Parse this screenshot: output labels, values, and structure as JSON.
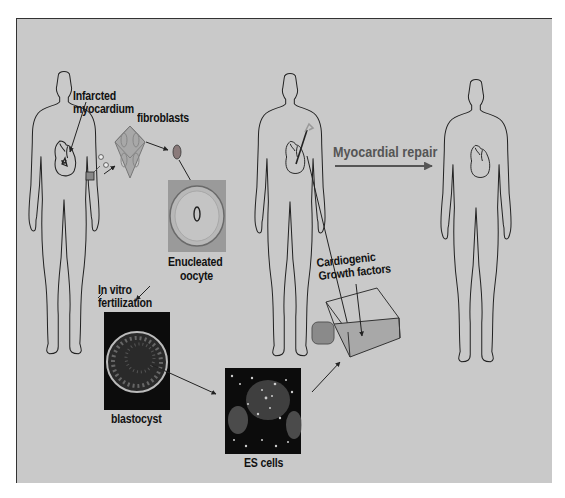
{
  "figure": {
    "background": "#c9c9c9",
    "labels": {
      "infarcted": "Infarcted",
      "myocardium": "myocardium",
      "fibroblasts": "fibroblasts",
      "enucleated": "Enucleated",
      "oocyte": "oocyte",
      "in_vitro": "In vitro",
      "fertilization": "fertilization",
      "blastocyst": "blastocyst",
      "es_cells": "ES cells",
      "cardiogenic": "Cardiogenic",
      "growth_factors": "Growth factors",
      "myocardial_repair": "Myocardial repair"
    },
    "stages": [
      "Infarcted myocardium",
      "fibroblasts",
      "Enucleated oocyte",
      "In vitro fertilization",
      "blastocyst",
      "ES cells",
      "Cardiogenic Growth factors",
      "Myocardial repair"
    ]
  }
}
